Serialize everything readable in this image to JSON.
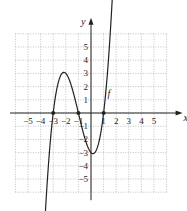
{
  "chart_data": {
    "type": "line",
    "title": "",
    "xlabel": "x",
    "ylabel": "y",
    "xlim": [
      -6,
      6
    ],
    "ylim": [
      -6,
      6
    ],
    "grid": true,
    "grid_style": "dotted",
    "x_ticks": [
      -5,
      -4,
      -3,
      -2,
      -1,
      1,
      2,
      3,
      4,
      5
    ],
    "y_ticks": [
      -5,
      -4,
      -3,
      -2,
      -1,
      1,
      2,
      3,
      4,
      5
    ],
    "x_tick_labels": [
      "−5",
      "−4",
      "−3",
      "−2",
      "−1",
      "1",
      "2",
      "3",
      "4",
      "5"
    ],
    "y_tick_labels": [
      "−5",
      "−4",
      "−3",
      "−2",
      "−1",
      "1",
      "2",
      "3",
      "4",
      "5"
    ],
    "series": [
      {
        "name": "f",
        "label": "f",
        "description": "cubic polynomial with zeros at x = -3, -1, 1; local max (-2, 3); local min (0, -3)",
        "x": [
          -3.7,
          -3.5,
          -3,
          -2.5,
          -2,
          -1.5,
          -1,
          -0.5,
          0,
          0.5,
          1,
          1.5,
          1.85
        ],
        "values": [
          -6.2,
          -3.75,
          0,
          2.0,
          3.0,
          2.06,
          0,
          -2.06,
          -3.0,
          -2.06,
          0,
          3.75,
          6.2
        ],
        "marked_points": [
          [
            -3,
            0
          ],
          [
            -1,
            0
          ],
          [
            1,
            0
          ]
        ],
        "arrows_both_ends": true
      }
    ],
    "annotations": [
      {
        "text": "f",
        "x": 1.3,
        "y": 1.2
      }
    ]
  }
}
